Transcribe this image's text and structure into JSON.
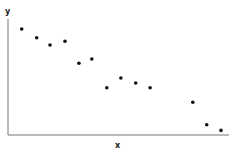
{
  "chart_data": {
    "type": "scatter",
    "title": "",
    "xlabel": "x",
    "ylabel": "y",
    "xlim": [
      0,
      100
    ],
    "ylim": [
      0,
      100
    ],
    "grid": false,
    "legend": null,
    "points": [
      {
        "x": 6.2,
        "y": 91.4
      },
      {
        "x": 13.0,
        "y": 83.9
      },
      {
        "x": 19.0,
        "y": 77.6
      },
      {
        "x": 25.8,
        "y": 80.8
      },
      {
        "x": 32.1,
        "y": 61.8
      },
      {
        "x": 37.9,
        "y": 65.5
      },
      {
        "x": 44.7,
        "y": 40.8
      },
      {
        "x": 51.1,
        "y": 49.1
      },
      {
        "x": 57.8,
        "y": 44.8
      },
      {
        "x": 64.3,
        "y": 40.8
      },
      {
        "x": 83.6,
        "y": 28.2
      },
      {
        "x": 89.9,
        "y": 8.9
      },
      {
        "x": 96.4,
        "y": 4.0
      }
    ]
  },
  "colors": {
    "point": "#111111",
    "axis": "#777777",
    "label": "#222222"
  }
}
